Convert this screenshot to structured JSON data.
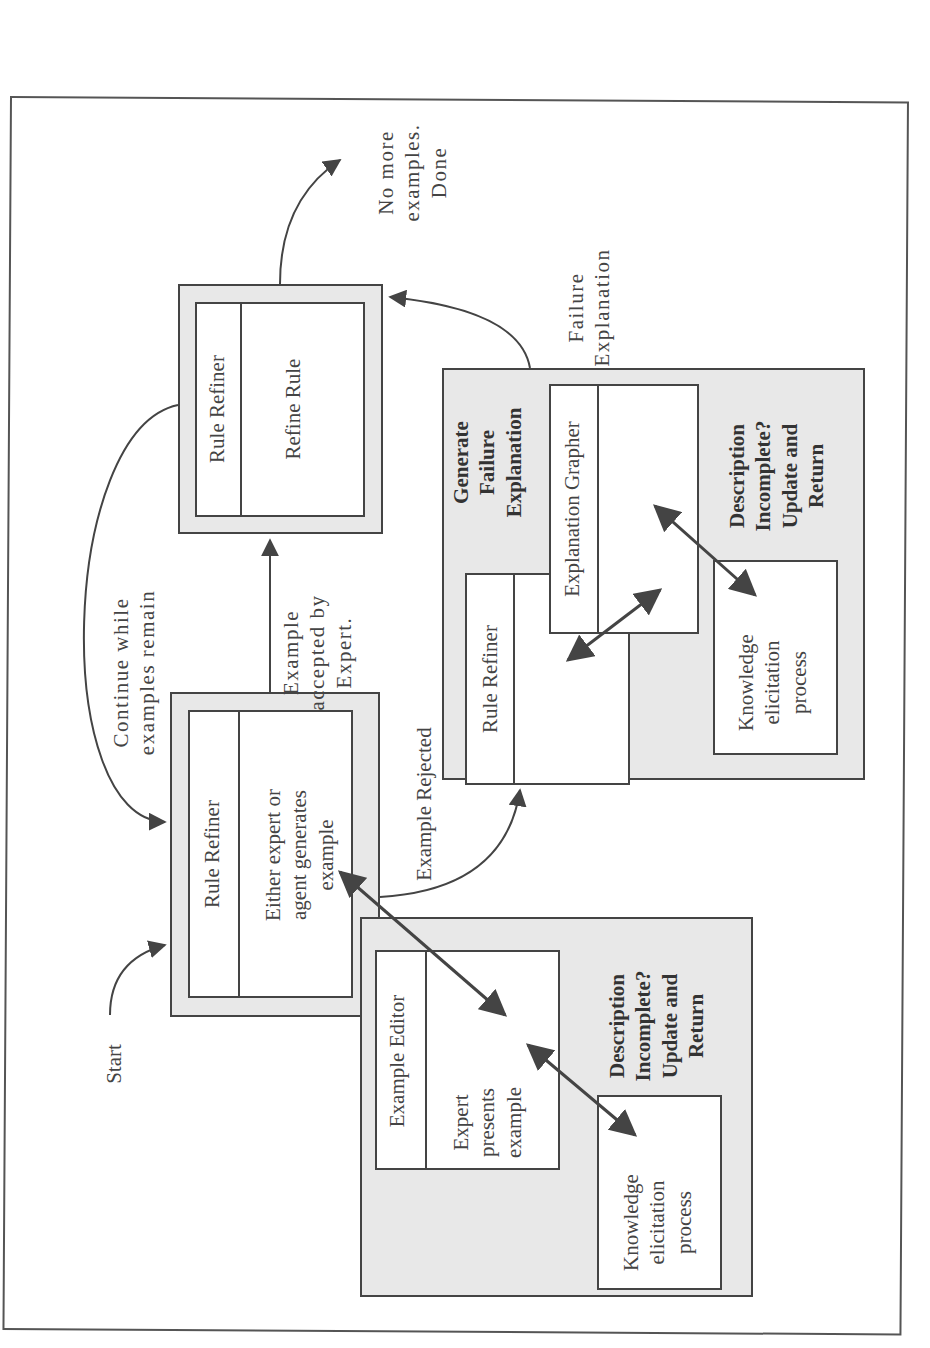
{
  "diagram": {
    "orientation": "rotated-90-ccw",
    "start_label": "Start",
    "loop_label": "Continue while\nexamples remain",
    "done_label": "No more\nexamples.\nDone",
    "accepted_label": "Example\naccepted by\nExpert.",
    "rejected_label": "Example Rejected",
    "failure_explanation_label": "Failure\nExplanation",
    "generate_box": {
      "title": "Rule Refiner",
      "body": "Either expert or\nagent generates\nexample"
    },
    "refine_box": {
      "title": "Rule Refiner",
      "body": "Refine Rule"
    },
    "failure_panel": {
      "heading": "Generate\nFailure\nExplanation",
      "rule_refiner_title": "Rule Refiner",
      "grapher_title": "Explanation Grapher",
      "knowledge_box": "Knowledge\nelicitation\nprocess",
      "note": "Description\nIncomplete?\nUpdate and\nReturn"
    },
    "example_panel": {
      "editor_title": "Example Editor",
      "editor_body": "Expert\npresents\nexample",
      "knowledge_box": "Knowledge\nelicitation\nprocess",
      "note": "Description\nIncomplete?\nUpdate and\nReturn"
    },
    "colors": {
      "line": "#444444",
      "panel_fill": "#e8e8e8",
      "box_fill": "#ffffff"
    }
  }
}
